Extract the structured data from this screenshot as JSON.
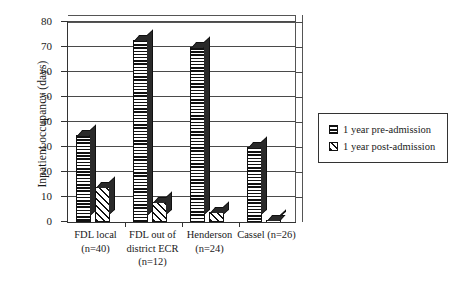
{
  "chart_data": {
    "type": "bar",
    "title": "",
    "subtitle": "",
    "xlabel": "",
    "ylabel": "Inpatient occupancy (days)",
    "ylim": [
      0,
      80
    ],
    "yticks": [
      0,
      10,
      20,
      30,
      40,
      50,
      60,
      70,
      80
    ],
    "ytick_labels": [
      "0",
      "10",
      "20",
      "30",
      "40",
      "50",
      "60",
      "70",
      "80"
    ],
    "grid": true,
    "grid_axis": "y",
    "legend_position": "right-outside",
    "style": "3d-bar",
    "categories": [
      "FDL local\n(n=40)",
      "FDL out of\ndistrict ECR\n(n=12)",
      "Henderson\n(n=24)",
      "Cassel (n=26)"
    ],
    "series": [
      {
        "name": "1 year pre-admission",
        "pattern": "horizontal-hatch",
        "values": [
          35,
          73,
          70,
          30
        ]
      },
      {
        "name": "1 year post-admission",
        "pattern": "diagonal-hatch",
        "values": [
          14,
          8,
          4,
          1
        ]
      }
    ]
  },
  "legend": {
    "items": [
      {
        "label": "1 year pre-admission",
        "pattern": "horizontal-hatch"
      },
      {
        "label": "1 year post-admission",
        "pattern": "diagonal-hatch"
      }
    ]
  },
  "colors": {
    "axis": "#333333",
    "grid": "#4a4a4a",
    "bar_outline": "#111111",
    "bar_fill": "#ffffff",
    "background": "#ffffff"
  }
}
